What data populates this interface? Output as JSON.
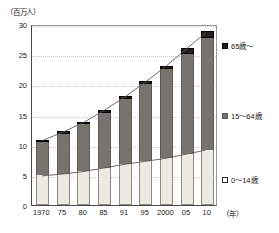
{
  "chart_data": {
    "type": "bar",
    "stacked": true,
    "title": "",
    "unit_label": "（百万人）",
    "xlabel": "（年）",
    "ylabel": "",
    "ylim": [
      0,
      30
    ],
    "yticks": [
      0,
      5,
      10,
      15,
      20,
      25,
      30
    ],
    "grid": true,
    "legend_position": "right",
    "categories": [
      "1970",
      "75",
      "80",
      "85",
      "91",
      "95",
      "2000",
      "05",
      "10"
    ],
    "series": [
      {
        "name": "0～14歳",
        "key": "young",
        "color": "#eceae2",
        "values": [
          4.9,
          5.2,
          5.6,
          6.2,
          6.8,
          7.3,
          7.8,
          8.5,
          9.2
        ]
      },
      {
        "name": "15～64歳",
        "key": "mid",
        "color": "#77746f",
        "values": [
          5.6,
          6.6,
          7.8,
          9.1,
          10.7,
          12.7,
          14.7,
          16.6,
          18.5
        ]
      },
      {
        "name": "65歳～",
        "key": "old",
        "color": "#241f1c",
        "values": [
          0.3,
          0.4,
          0.4,
          0.5,
          0.5,
          0.5,
          0.6,
          0.9,
          1.2
        ]
      }
    ],
    "totals": [
      10.8,
      12.2,
      13.8,
      15.8,
      18.0,
      20.5,
      23.1,
      26.0,
      28.9
    ]
  },
  "legend": {
    "items": [
      {
        "label": "65歳～",
        "swatch": "old-swatch"
      },
      {
        "label": "15～64歳",
        "swatch": "mid-swatch"
      },
      {
        "label": "0～14歳",
        "swatch": "young-swatch"
      }
    ]
  },
  "axis": {
    "unit": "（百万人）",
    "x_unit": "（年）",
    "y_tick_labels": [
      "0",
      "5",
      "10",
      "15",
      "20",
      "25",
      "30"
    ],
    "x_tick_labels": [
      "1970",
      "75",
      "80",
      "85",
      "91",
      "95",
      "2000",
      "05",
      "10"
    ]
  }
}
